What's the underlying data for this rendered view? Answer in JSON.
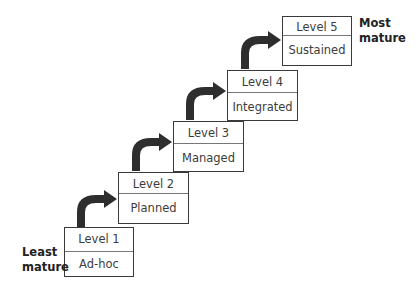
{
  "diagram": {
    "type": "maturity-staircase",
    "levels": [
      {
        "level": "Level 1",
        "name": "Ad-hoc"
      },
      {
        "level": "Level 2",
        "name": "Planned"
      },
      {
        "level": "Level 3",
        "name": "Managed"
      },
      {
        "level": "Level 4",
        "name": "Integrated"
      },
      {
        "level": "Level 5",
        "name": "Sustained"
      }
    ],
    "labels": {
      "least_line1": "Least",
      "least_line2": "mature",
      "most_line1": "Most",
      "most_line2": "mature"
    },
    "colors": {
      "box_border": "#3a3a3a",
      "arrow": "#2e2e2e",
      "text": "#3c3c3c"
    }
  }
}
